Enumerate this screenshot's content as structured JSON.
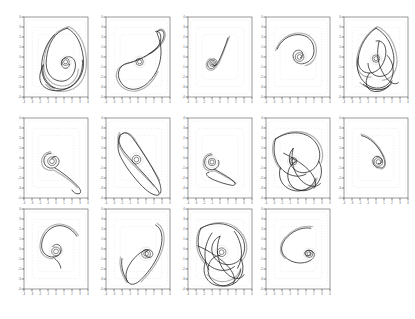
{
  "figure": {
    "title": "",
    "background_color": "#ffffff",
    "grid_rows": 3,
    "grid_cols": 5,
    "panel_count": 14,
    "curve_color": "#1a1a1a",
    "ghost_curve_color": "#b0b0b0",
    "frame_color": "#555555",
    "inner_guide_color": "#cccccc",
    "tick_color": "#333333"
  },
  "chart_data": {
    "type": "line",
    "title": "",
    "xlabel": "",
    "ylabel": "",
    "grid": false,
    "legend": "none",
    "xlim": [
      -4,
      4
    ],
    "ylim": [
      -4,
      4
    ],
    "xticks": [
      "-4",
      "-3",
      "-2",
      "-1",
      "0",
      "1",
      "2",
      "3",
      "4"
    ],
    "yticks": [
      "4",
      "3",
      "2",
      "1",
      "0",
      "-1",
      "-2",
      "-3",
      "-4"
    ],
    "panels": [
      {
        "id": "panel-1",
        "row": 1,
        "col": 1,
        "shape": "large-lobed-orbit-with-inner-spiral",
        "complexity": "high",
        "path_main": "M 54 14 C 38 18 30 34 28 52 C 26 68 33 78 44 80 C 54 82 62 74 64 64 C 66 54 60 48 53 50 C 47 52 45 58 48 62 C 51 66 57 64 57 59 M 54 14 C 66 20 72 34 74 50 C 76 64 72 76 63 84 C 54 92 42 92 34 86 C 26 80 22 70 24 60 M 24 60 C 18 72 18 82 26 88 C 36 95 52 93 62 84 C 70 77 74 66 73 54 M 38 22 C 28 32 22 48 22 62 C 22 76 28 86 38 89",
        "path_ghost": "M 56 12 C 36 17 27 35 25 54 C 23 72 31 84 45 86 C 58 88 67 78 68 65 M 56 12 C 70 19 77 36 78 53 C 79 70 73 84 61 90 C 48 96 34 93 27 84",
        "spiral_cx": 52,
        "spiral_cy": 56,
        "spiral_r": 6
      },
      {
        "id": "panel-2",
        "row": 1,
        "col": 2,
        "shape": "kite-with-upper-right-loop",
        "complexity": "medium",
        "path_main": "M 64 18 C 70 14 74 18 72 26 C 70 34 62 40 54 46 C 44 53 34 56 26 58 C 18 60 14 68 16 76 C 19 86 28 92 38 90 C 48 88 56 80 62 70 C 68 60 70 46 68 34 C 66 24 62 18 64 18 Z M 54 46 C 60 44 66 38 68 30 C 70 22 66 16 62 18",
        "path_ghost": "M 66 16 C 72 13 76 19 73 28 C 70 37 60 43 51 48 C 41 54 30 57 22 60 C 14 63 11 71 14 79 C 18 89 29 95 40 92 C 51 89 60 79 65 68",
        "spiral_cx": 42,
        "spiral_cy": 56,
        "spiral_r": 6
      },
      {
        "id": "panel-3",
        "row": 1,
        "col": 3,
        "shape": "descending-line-into-small-spiral",
        "complexity": "low",
        "path_main": "M 50 26 C 46 38 42 48 38 56 C 34 63 30 66 27 64 C 23 61 24 55 29 53 C 34 51 38 55 36 59 C 34 62 30 61 31 58",
        "path_ghost": "M 52 24 C 47 37 43 48 39 57 C 35 65 30 68 26 66 C 21 63 22 55 28 52",
        "spiral_cx": 31,
        "spiral_cy": 58,
        "spiral_r": 5
      },
      {
        "id": "panel-4",
        "row": 1,
        "col": 4,
        "shape": "hook-curve-into-circle",
        "complexity": "low",
        "path_main": "M 14 40 C 18 30 28 22 40 22 C 52 22 60 30 60 42 C 60 50 55 56 48 58 C 41 60 35 56 34 50 C 33 44 38 40 43 42 C 47 44 47 50 43 51",
        "path_ghost": "M 12 42 C 16 29 28 20 41 20 C 54 20 63 29 63 42 C 63 52 57 59 49 61",
        "spiral_cx": 42,
        "spiral_cy": 50,
        "spiral_r": 7
      },
      {
        "id": "panel-5",
        "row": 1,
        "col": 5,
        "shape": "multi-loop-butterfly",
        "complexity": "very-high",
        "path_main": "M 40 14 C 28 22 20 36 18 50 C 16 62 22 70 32 70 C 42 70 50 60 52 48 C 54 36 48 28 40 30 M 40 14 C 52 20 60 34 62 48 C 64 62 58 72 48 74 C 38 76 30 68 30 58 M 18 50 C 14 62 18 76 28 84 C 38 92 52 90 58 80 C 64 70 62 56 54 48 M 32 70 C 26 78 26 88 34 92 C 44 96 56 90 60 80 M 24 84 C 34 92 48 94 56 86 M 44 30 C 40 44 42 60 50 72 C 56 82 64 86 68 82",
        "path_ghost": "M 42 12 C 28 20 18 36 16 52 C 14 66 22 76 34 75 M 42 12 C 56 19 64 34 66 50 C 68 66 60 78 48 79 M 20 82 C 32 93 50 94 60 83",
        "spiral_cx": 40,
        "spiral_cy": 52,
        "spiral_r": 6
      },
      {
        "id": "panel-6",
        "row": 2,
        "col": 1,
        "shape": "spiral-with-descending-tail",
        "complexity": "low",
        "path_main": "M 34 44 C 28 44 24 49 25 55 C 26 61 32 64 38 62 C 43 60 45 55 43 51 C 41 47 36 47 35 51 M 38 62 C 48 68 58 76 66 84 C 70 88 72 92 70 94 C 67 96 62 94 60 90",
        "path_ghost": "M 33 42 C 26 43 21 49 22 56 C 23 63 30 67 37 65 M 37 65 C 48 71 59 79 67 87",
        "spiral_cx": 35,
        "spiral_cy": 54,
        "spiral_r": 7
      },
      {
        "id": "panel-7",
        "row": 2,
        "col": 2,
        "shape": "elongated-lens-leaf",
        "complexity": "medium",
        "path_main": "M 18 20 C 14 26 16 34 24 44 C 34 56 48 70 58 82 C 64 89 68 94 66 96 C 62 98 54 94 46 86 C 34 74 24 60 18 48 C 14 40 14 30 18 22 C 22 16 28 18 34 26 C 44 40 56 58 64 74 C 68 82 70 90 68 94",
        "path_ghost": "M 17 18 C 12 26 15 35 23 46 C 34 59 49 73 60 85 M 20 20 C 26 16 32 20 38 30 C 48 46 60 64 67 78",
        "spiral_cx": 38,
        "spiral_cy": 52,
        "spiral_r": 7
      },
      {
        "id": "panel-8",
        "row": 2,
        "col": 3,
        "shape": "circle-with-sweeping-tail",
        "complexity": "low",
        "path_main": "M 30 46 C 24 46 20 51 21 57 C 22 63 28 66 33 64 C 38 62 40 57 38 53 M 33 64 C 44 70 54 76 58 80 C 60 83 58 85 54 84 C 44 82 32 78 26 74 C 22 71 22 68 26 68",
        "path_ghost": "M 29 44 C 22 45 18 51 19 58 C 20 65 27 68 33 66 M 33 66 C 45 72 56 78 60 82",
        "spiral_cx": 30,
        "spiral_cy": 55,
        "spiral_r": 6
      },
      {
        "id": "panel-9",
        "row": 2,
        "col": 4,
        "shape": "chaotic-dense-orbit",
        "complexity": "very-high",
        "path_main": "M 12 26 C 24 18 40 16 52 22 C 64 28 70 42 66 54 C 62 66 48 72 38 66 C 28 60 26 46 34 38 M 12 26 C 8 38 10 52 18 62 C 26 72 40 76 50 70 M 66 54 C 72 64 70 78 60 86 C 50 94 36 92 30 82 C 24 72 28 58 38 54 M 18 62 C 14 74 20 86 32 90 C 44 94 58 88 62 76 M 34 38 C 30 52 34 68 44 78 C 52 86 62 88 68 82 M 22 44 C 34 50 48 58 56 68 C 62 76 64 84 60 88",
        "path_ghost": "M 10 28 C 24 16 42 14 55 21 C 68 28 74 43 69 56 M 10 28 C 6 40 9 54 18 64 M 28 84 C 44 96 60 89 64 75",
        "spiral_cx": 34,
        "spiral_cy": 54,
        "spiral_r": 6
      },
      {
        "id": "panel-10",
        "row": 2,
        "col": 5,
        "shape": "arc-descending-into-circle",
        "complexity": "low",
        "path_main": "M 22 22 C 32 24 42 34 48 46 C 52 54 52 60 48 62 C 42 64 36 60 36 54 C 36 48 42 46 46 50 C 49 53 47 58 43 57",
        "path_ghost": "M 21 20 C 32 22 43 33 49 46 C 54 56 52 63 46 64",
        "spiral_cx": 43,
        "spiral_cy": 55,
        "spiral_r": 7
      },
      {
        "id": "panel-11",
        "row": 3,
        "col": 1,
        "shape": "arch-hook-into-circle",
        "complexity": "low",
        "path_main": "M 66 34 C 60 24 48 18 38 22 C 28 26 22 36 22 46 C 22 54 28 60 36 60 C 44 60 48 54 46 48 C 44 43 38 43 36 47 M 36 60 C 42 64 46 70 46 74",
        "path_ghost": "M 68 33 C 61 22 48 16 37 20 C 26 24 20 36 20 47 C 20 56 27 62 36 62",
        "spiral_cx": 40,
        "spiral_cy": 53,
        "spiral_r": 7
      },
      {
        "id": "panel-12",
        "row": 3,
        "col": 2,
        "shape": "comma-flag-loop",
        "complexity": "medium",
        "path_main": "M 62 20 C 70 24 72 36 68 50 C 64 64 54 78 44 88 C 38 94 32 96 28 92 C 24 88 24 80 28 72 C 32 64 38 58 44 54 C 50 50 56 50 58 54 C 60 58 56 62 52 60 C 48 58 48 53 52 52 M 28 92 C 22 84 18 72 20 62",
        "path_ghost": "M 64 18 C 73 23 75 37 70 52 C 65 67 54 81 44 91 M 26 92 C 20 83 16 71 18 60",
        "spiral_cx": 50,
        "spiral_cy": 56,
        "spiral_r": 7
      },
      {
        "id": "panel-13",
        "row": 3,
        "col": 3,
        "shape": "very-dense-chaotic-orbit",
        "complexity": "very-high",
        "path_main": "M 16 24 C 30 16 48 16 60 26 C 72 36 74 52 66 62 C 58 72 42 72 34 62 C 26 52 30 38 40 34 M 16 24 C 10 38 12 54 22 66 C 32 78 48 80 58 72 M 66 62 C 72 74 68 88 56 94 C 44 100 30 94 26 82 C 22 70 30 58 40 58 M 22 66 C 16 80 24 94 38 96 C 52 98 64 88 66 76 M 40 34 C 34 48 36 66 46 78 C 54 88 66 90 70 82 M 12 46 C 26 52 42 62 52 74 C 58 82 60 90 56 94 M 30 30 C 20 44 18 62 26 76 M 58 28 C 68 42 70 60 62 74",
        "path_ghost": "M 14 26 C 30 14 50 14 62 25 C 75 36 77 53 68 64 M 14 26 C 8 40 10 56 21 68 M 24 82 C 40 98 62 90 66 74",
        "spiral_cx": 42,
        "spiral_cy": 54,
        "spiral_r": 7
      },
      {
        "id": "panel-14",
        "row": 3,
        "col": 4,
        "shape": "swoop-into-small-spiral",
        "complexity": "low",
        "path_main": "M 56 24 C 44 22 32 28 24 38 C 18 46 18 54 24 60 C 32 68 46 70 56 64 C 62 60 62 54 56 52 C 50 50 46 55 50 58 C 53 60 57 57 55 54",
        "path_ghost": "M 58 22 C 44 20 31 27 22 38 C 16 47 17 56 24 62",
        "spiral_cx": 54,
        "spiral_cy": 56,
        "spiral_r": 6
      }
    ]
  }
}
